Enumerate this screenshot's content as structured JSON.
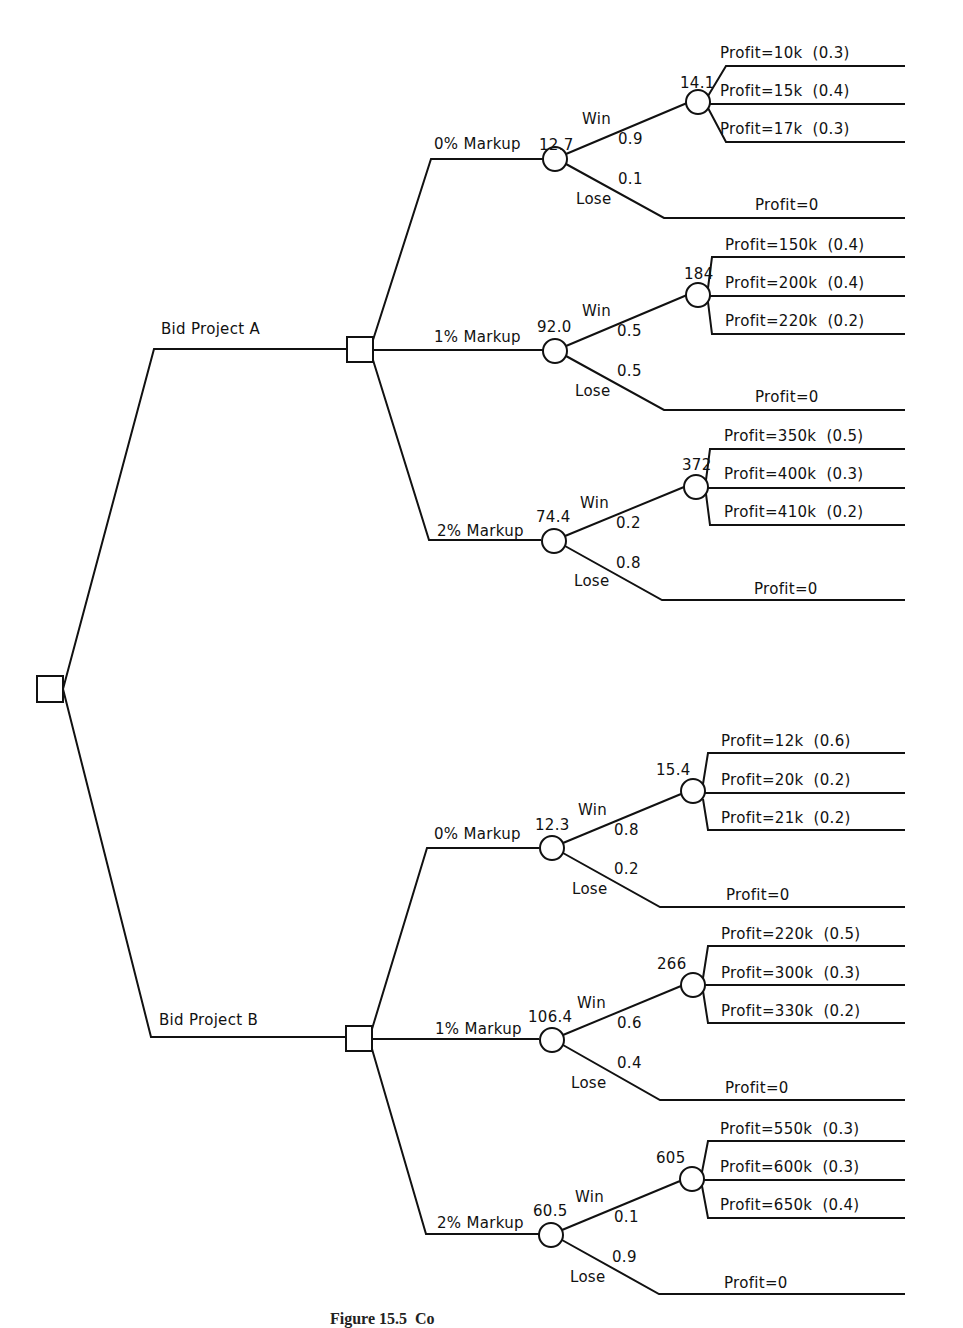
{
  "diagram": {
    "type": "decision-tree",
    "root": {
      "node_type": "decision"
    },
    "projects": [
      {
        "label": "Bid Project A",
        "node_type": "decision",
        "markups": [
          {
            "label": "0% Markup",
            "ev": "12.7",
            "win_label": "Win",
            "win_prob": "0.9",
            "lose_label": "Lose",
            "lose_prob": "0.1",
            "win_ev": "14.1",
            "outcomes": [
              {
                "label": "Profit=10k  (0.3)"
              },
              {
                "label": "Profit=15k  (0.4)"
              },
              {
                "label": "Profit=17k  (0.3)"
              }
            ],
            "lose_outcome": "Profit=0"
          },
          {
            "label": "1% Markup",
            "ev": "92.0",
            "win_label": "Win",
            "win_prob": "0.5",
            "lose_label": "Lose",
            "lose_prob": "0.5",
            "win_ev": "184",
            "outcomes": [
              {
                "label": "Profit=150k  (0.4)"
              },
              {
                "label": "Profit=200k  (0.4)"
              },
              {
                "label": "Profit=220k  (0.2)"
              }
            ],
            "lose_outcome": "Profit=0"
          },
          {
            "label": "2% Markup",
            "ev": "74.4",
            "win_label": "Win",
            "win_prob": "0.2",
            "lose_label": "Lose",
            "lose_prob": "0.8",
            "win_ev": "372",
            "outcomes": [
              {
                "label": "Profit=350k  (0.5)"
              },
              {
                "label": "Profit=400k  (0.3)"
              },
              {
                "label": "Profit=410k  (0.2)"
              }
            ],
            "lose_outcome": "Profit=0"
          }
        ]
      },
      {
        "label": "Bid Project B",
        "node_type": "decision",
        "markups": [
          {
            "label": "0% Markup",
            "ev": "12.3",
            "win_label": "Win",
            "win_prob": "0.8",
            "lose_label": "Lose",
            "lose_prob": "0.2",
            "win_ev": "15.4",
            "outcomes": [
              {
                "label": "Profit=12k  (0.6)"
              },
              {
                "label": "Profit=20k  (0.2)"
              },
              {
                "label": "Profit=21k  (0.2)"
              }
            ],
            "lose_outcome": "Profit=0"
          },
          {
            "label": "1% Markup",
            "ev": "106.4",
            "win_label": "Win",
            "win_prob": "0.6",
            "lose_label": "Lose",
            "lose_prob": "0.4",
            "win_ev": "266",
            "outcomes": [
              {
                "label": "Profit=220k  (0.5)"
              },
              {
                "label": "Profit=300k  (0.3)"
              },
              {
                "label": "Profit=330k  (0.2)"
              }
            ],
            "lose_outcome": "Profit=0"
          },
          {
            "label": "2% Markup",
            "ev": "60.5",
            "win_label": "Win",
            "win_prob": "0.1",
            "lose_label": "Lose",
            "lose_prob": "0.9",
            "win_ev": "605",
            "outcomes": [
              {
                "label": "Profit=550k  (0.3)"
              },
              {
                "label": "Profit=600k  (0.3)"
              },
              {
                "label": "Profit=650k  (0.4)"
              }
            ],
            "lose_outcome": "Profit=0"
          }
        ]
      }
    ],
    "caption": "Figure 15.5  Co"
  }
}
